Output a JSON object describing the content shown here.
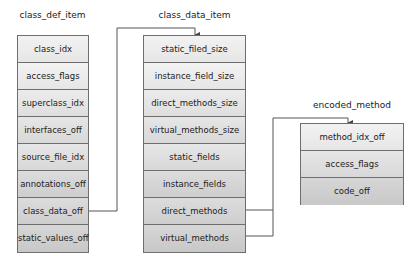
{
  "diagram": {
    "structures": [
      {
        "id": "class_def_item",
        "title": "class_def_item",
        "fields": [
          "class_idx",
          "access_flags",
          "superclass_idx",
          "interfaces_off",
          "source_file_idx",
          "annotations_off",
          "class_data_off",
          "static_values_off"
        ]
      },
      {
        "id": "class_data_item",
        "title": "class_data_item",
        "fields": [
          "static_filed_size",
          "instance_field_size",
          "direct_methods_size",
          "virtual_methods_size",
          "static_fields",
          "instance_fields",
          "direct_methods",
          "virtual_methods"
        ]
      },
      {
        "id": "encoded_method",
        "title": "encoded_method",
        "fields": [
          "method_idx_off",
          "access_flags",
          "code_off"
        ]
      }
    ],
    "connections": [
      {
        "from": "class_def_item.class_data_off",
        "to": "class_data_item"
      },
      {
        "from": "class_data_item.direct_methods",
        "to": "encoded_method"
      },
      {
        "from": "class_data_item.virtual_methods",
        "to": "encoded_method"
      }
    ],
    "colors": {
      "line": "#555555",
      "border": "#6e6e6e"
    }
  }
}
